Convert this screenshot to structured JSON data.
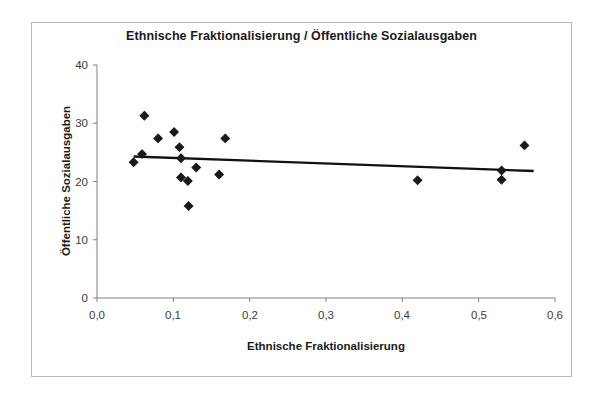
{
  "chart_data": {
    "type": "scatter",
    "title": "Ethnische Fraktionalisierung / Öffentliche Sozialausgaben",
    "xlabel": "Ethnische Fraktionalisierung",
    "ylabel": "Öffentliche Sozialausgaben",
    "xlim": [
      0.0,
      0.6
    ],
    "ylim": [
      0,
      40
    ],
    "xticks": [
      0.0,
      0.1,
      0.2,
      0.3,
      0.4,
      0.5,
      0.6
    ],
    "xtick_labels": [
      "0,0",
      "0,1",
      "0,2",
      "0,3",
      "0,4",
      "0,5",
      "0,6"
    ],
    "yticks": [
      0,
      10,
      20,
      30,
      40
    ],
    "ytick_labels": [
      "0",
      "10",
      "20",
      "30",
      "40"
    ],
    "grid": false,
    "legend": false,
    "marker": "diamond",
    "marker_color": "#1a1a1a",
    "series": [
      {
        "name": "Länder",
        "points": [
          {
            "x": 0.048,
            "y": 23.3
          },
          {
            "x": 0.059,
            "y": 24.7
          },
          {
            "x": 0.062,
            "y": 31.3
          },
          {
            "x": 0.08,
            "y": 27.4
          },
          {
            "x": 0.101,
            "y": 28.5
          },
          {
            "x": 0.108,
            "y": 25.9
          },
          {
            "x": 0.11,
            "y": 24.0
          },
          {
            "x": 0.11,
            "y": 20.7
          },
          {
            "x": 0.119,
            "y": 20.1
          },
          {
            "x": 0.12,
            "y": 15.8
          },
          {
            "x": 0.13,
            "y": 22.4
          },
          {
            "x": 0.16,
            "y": 21.2
          },
          {
            "x": 0.168,
            "y": 27.4
          },
          {
            "x": 0.42,
            "y": 20.2
          },
          {
            "x": 0.53,
            "y": 21.9
          },
          {
            "x": 0.53,
            "y": 20.3
          },
          {
            "x": 0.56,
            "y": 26.2
          }
        ]
      }
    ],
    "trendline": {
      "type": "linear",
      "color": "#111111",
      "x_start": 0.048,
      "y_start": 24.3,
      "x_end": 0.572,
      "y_end": 21.8
    }
  }
}
